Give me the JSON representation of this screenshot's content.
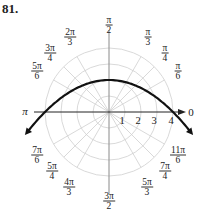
{
  "problem_number": "81.",
  "graph": {
    "type": "polar",
    "equation_shape": "parabola opening downward, vertex at r=2 on theta=pi/2, crossing r=4 at theta=0 and theta=pi",
    "center_px": [
      109,
      112
    ],
    "unit_px": 16,
    "rings": [
      1,
      2,
      3,
      4
    ],
    "radial_labels": [
      "1",
      "2",
      "3",
      "4"
    ],
    "spoke_angles_deg": [
      0,
      30,
      45,
      60,
      90,
      120,
      135,
      150,
      180,
      210,
      225,
      240,
      270,
      300,
      315,
      330
    ],
    "colors": {
      "grid": "#cccccc",
      "axis_vertical": "#888888",
      "axis_horizontal": "#222222",
      "curve": "#111111"
    }
  },
  "angle_labels": {
    "a0": "0",
    "a_pi": "π",
    "pi_6": {
      "num": "π",
      "den": "6"
    },
    "pi_4": {
      "num": "π",
      "den": "4"
    },
    "pi_3": {
      "num": "π",
      "den": "3"
    },
    "pi_2": {
      "num": "π",
      "den": "2"
    },
    "two_pi_3": {
      "num": "2π",
      "den": "3"
    },
    "three_pi_4": {
      "num": "3π",
      "den": "4"
    },
    "five_pi_6": {
      "num": "5π",
      "den": "6"
    },
    "seven_pi_6": {
      "num": "7π",
      "den": "6"
    },
    "five_pi_4": {
      "num": "5π",
      "den": "4"
    },
    "four_pi_3": {
      "num": "4π",
      "den": "3"
    },
    "three_pi_2": {
      "num": "3π",
      "den": "2"
    },
    "five_pi_3": {
      "num": "5π",
      "den": "3"
    },
    "seven_pi_4": {
      "num": "7π",
      "den": "4"
    },
    "eleven_pi_6": {
      "num": "11π",
      "den": "6"
    }
  }
}
